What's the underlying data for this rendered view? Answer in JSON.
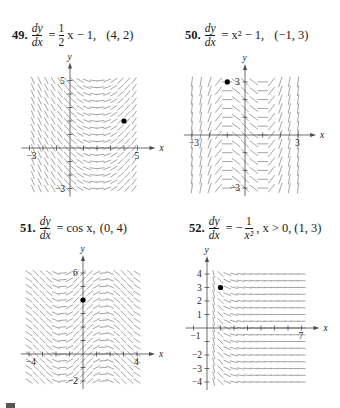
{
  "colors": {
    "segment": "#9a9a9a",
    "axis": "#4a4a4a",
    "point": "#000000",
    "text": "#1a1a1a"
  },
  "problems": [
    {
      "number": "49.",
      "lhs_num": "dy",
      "lhs_den": "dx",
      "rhs_prefix": "",
      "rhs_frac_num": "1",
      "rhs_frac_den": "2",
      "rhs_suffix": "x − 1,",
      "condition": "(4, 2)"
    },
    {
      "number": "50.",
      "lhs_num": "dy",
      "lhs_den": "dx",
      "rhs_text": "x² − 1,",
      "condition": "(−1, 3)"
    },
    {
      "number": "51.",
      "lhs_num": "dy",
      "lhs_den": "dx",
      "rhs_text": "cos x,",
      "condition": "(0, 4)"
    },
    {
      "number": "52.",
      "lhs_num": "dy",
      "lhs_den": "dx",
      "rhs_prefix": "−",
      "rhs_frac_num": "1",
      "rhs_frac_den": "x²",
      "rhs_suffix": ", x > 0,",
      "condition": "(1, 3)"
    }
  ],
  "chart_data": [
    {
      "type": "scatter",
      "title": "49. dy/dx = (1/2)x − 1, (4, 2)",
      "kind": "slope_field",
      "equation": "dy/dx = 0.5*x - 1",
      "xlabel": "x",
      "ylabel": "y",
      "xlim": [
        -3,
        5
      ],
      "ylim": [
        -3,
        5
      ],
      "x_tick_labels": [
        "-3",
        "5"
      ],
      "y_tick_labels": [
        "5",
        "-3"
      ],
      "grid": false,
      "initial_point": [
        4,
        2
      ],
      "origin_px": [
        70,
        148
      ],
      "unit_px": [
        13.5,
        13.5
      ],
      "field_x_range": [
        -2.75,
        5.0
      ],
      "field_y_range": [
        -3.0,
        5.0
      ],
      "field_step": [
        0.5,
        0.5
      ]
    },
    {
      "type": "scatter",
      "title": "50. dy/dx = x² − 1, (−1, 3)",
      "kind": "slope_field",
      "equation": "dy/dx = x^2 - 1",
      "xlabel": "x",
      "ylabel": "y",
      "xlim": [
        -3,
        3
      ],
      "ylim": [
        -3,
        3
      ],
      "x_tick_labels": [
        "-3",
        "3"
      ],
      "y_tick_labels": [
        "3",
        "-3"
      ],
      "grid": false,
      "initial_point": [
        -1,
        3
      ],
      "origin_px": [
        245,
        135
      ],
      "unit_px": [
        17.7,
        17.7
      ],
      "field_x_range": [
        -3.0,
        3.0
      ],
      "field_y_range": [
        -3.0,
        3.0
      ],
      "field_step": [
        0.5,
        0.5
      ]
    },
    {
      "type": "scatter",
      "title": "51. dy/dx = cos x, (0, 4)",
      "kind": "slope_field",
      "equation": "dy/dx = cos(x)",
      "xlabel": "x",
      "ylabel": "y",
      "xlim": [
        -4,
        4
      ],
      "ylim": [
        -2,
        6
      ],
      "x_tick_labels": [
        "-4",
        "4"
      ],
      "y_tick_labels": [
        "6",
        "-2"
      ],
      "grid": false,
      "initial_point": [
        0,
        4
      ],
      "origin_px": [
        83,
        354
      ],
      "unit_px": [
        13.5,
        13.5
      ],
      "field_x_range": [
        -4.0,
        4.0
      ],
      "field_y_range": [
        -2.0,
        6.0
      ],
      "field_step": [
        0.5,
        0.5
      ]
    },
    {
      "type": "scatter",
      "title": "52. dy/dx = −1/x², x > 0, (1, 3)",
      "kind": "slope_field",
      "equation": "dy/dx = -1/x^2",
      "xlabel": "x",
      "ylabel": "y",
      "xlim": [
        -1,
        7
      ],
      "ylim": [
        -4,
        4
      ],
      "x_tick_labels": [
        "-1",
        "7"
      ],
      "y_tick_labels": [
        "4",
        "3",
        "2",
        "1",
        "-2",
        "-3",
        "-4"
      ],
      "grid": false,
      "initial_point": [
        1,
        3
      ],
      "origin_px": [
        207,
        328
      ],
      "unit_px": [
        13.5,
        13.5
      ],
      "field_x_range": [
        0.5,
        7.0
      ],
      "field_y_range": [
        -4.0,
        4.0
      ],
      "field_step": [
        0.5,
        0.5
      ]
    }
  ]
}
